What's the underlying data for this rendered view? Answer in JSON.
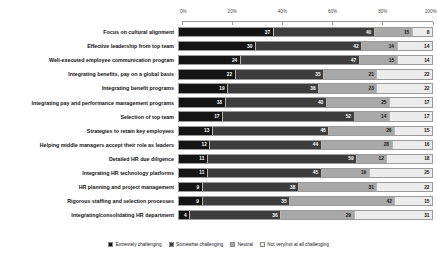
{
  "chart_data": {
    "type": "bar",
    "subtype": "stacked-horizontal-100pct",
    "title": "",
    "xlabel": "",
    "ylabel": "",
    "xlim": [
      0,
      100
    ],
    "grid": false,
    "legend_position": "bottom",
    "tick_labels": [
      "0%",
      "20%",
      "40%",
      "60%",
      "80%",
      "100%"
    ],
    "tick_values": [
      0,
      20,
      40,
      60,
      80,
      100
    ],
    "categories": [
      "Focus on cultural alignment",
      "Effective leadership from top team",
      "Well-executed employee communication program",
      "Integrating benefits, pay on a global basis",
      "Integrating benefit programs",
      "Integrating pay and performance management programs",
      "Selection of top team",
      "Strategies to retain key employees",
      "Helping middle managers accept their role as leaders",
      "Detailed HR due diligence",
      "Integrating HR technology platforms",
      "HR planning and project management",
      "Rigorous staffing and selection processes",
      "Integrating/consolidating HR department"
    ],
    "series": [
      {
        "name": "Extremely challenging",
        "color": "#141414",
        "values": [
          37,
          30,
          24,
          22,
          19,
          18,
          17,
          13,
          12,
          11,
          11,
          9,
          9,
          4
        ]
      },
      {
        "name": "Somewhat challenging",
        "color": "#3d3d3d",
        "values": [
          40,
          42,
          47,
          35,
          36,
          40,
          52,
          46,
          44,
          59,
          45,
          38,
          35,
          36
        ]
      },
      {
        "name": "Neutral",
        "color": "#a8a8a8",
        "values": [
          15,
          14,
          15,
          21,
          23,
          25,
          14,
          26,
          28,
          12,
          19,
          31,
          42,
          29
        ]
      },
      {
        "name": "Not very/not at all challenging",
        "color": "#ececec",
        "values": [
          8,
          14,
          14,
          22,
          22,
          17,
          17,
          15,
          16,
          18,
          25,
          22,
          15,
          31
        ]
      }
    ]
  }
}
